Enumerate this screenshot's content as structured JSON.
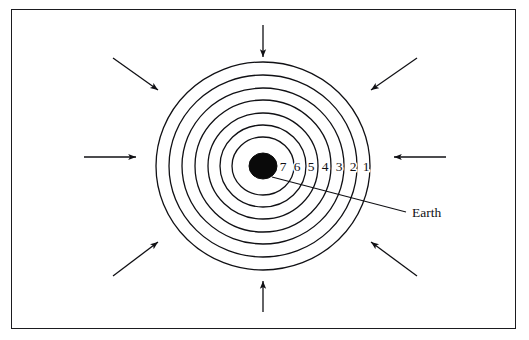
{
  "figure": {
    "title": "",
    "frame": {
      "x": 11,
      "y": 9,
      "width": 505,
      "height": 320,
      "stroke_color": "#1b1b1f",
      "stroke_width": 1.4,
      "background": "#ffffff"
    }
  },
  "chart_data": {
    "type": "diagram",
    "title": "",
    "subtitle": "",
    "center": {
      "x": 263,
      "y": 166
    },
    "core": {
      "label": "Earth",
      "fill": "#0a0a0a",
      "radius_x": 14,
      "radius_y": 13
    },
    "shell_count": 7,
    "shells": [
      {
        "label": "1",
        "index": 1,
        "radius_x": 107,
        "radius_y": 104,
        "label_x": 366,
        "label_y": 171
      },
      {
        "label": "2",
        "index": 2,
        "radius_x": 94,
        "radius_y": 91,
        "label_x": 353,
        "label_y": 171
      },
      {
        "label": "3",
        "index": 3,
        "radius_x": 81,
        "radius_y": 78,
        "label_x": 339,
        "label_y": 171
      },
      {
        "label": "4",
        "index": 4,
        "radius_x": 68,
        "radius_y": 66,
        "label_x": 325,
        "label_y": 171
      },
      {
        "label": "5",
        "index": 5,
        "radius_x": 55,
        "radius_y": 53,
        "label_x": 311,
        "label_y": 171
      },
      {
        "label": "6",
        "index": 6,
        "radius_x": 43,
        "radius_y": 41,
        "label_x": 297,
        "label_y": 171
      },
      {
        "label": "7",
        "index": 7,
        "radius_x": 31,
        "radius_y": 29,
        "label_x": 283,
        "label_y": 171
      }
    ],
    "shell_stroke_color": "#101014",
    "shell_stroke_width": 1.3,
    "annotations": [
      {
        "text": "Earth",
        "text_x": 412,
        "text_y": 217,
        "leader_from": {
          "x": 272,
          "y": 177
        },
        "leader_to": {
          "x": 406,
          "y": 212
        }
      }
    ],
    "arrows": {
      "count": 8,
      "direction": "inward",
      "color": "#101014",
      "stroke_width": 1.3,
      "items": [
        {
          "name": "arrow-top",
          "x1": 263,
          "y1": 25,
          "x2": 263,
          "y2": 57
        },
        {
          "name": "arrow-bottom",
          "x1": 263,
          "y1": 312,
          "x2": 263,
          "y2": 281
        },
        {
          "name": "arrow-left",
          "x1": 84,
          "y1": 157,
          "x2": 136,
          "y2": 157
        },
        {
          "name": "arrow-right",
          "x1": 446,
          "y1": 157,
          "x2": 394,
          "y2": 157
        },
        {
          "name": "arrow-top-left",
          "x1": 113,
          "y1": 58,
          "x2": 158,
          "y2": 90
        },
        {
          "name": "arrow-top-right",
          "x1": 417,
          "y1": 58,
          "x2": 371,
          "y2": 90
        },
        {
          "name": "arrow-bottom-left",
          "x1": 113,
          "y1": 276,
          "x2": 158,
          "y2": 242
        },
        {
          "name": "arrow-bottom-right",
          "x1": 417,
          "y1": 276,
          "x2": 371,
          "y2": 242
        }
      ]
    },
    "legend": [],
    "xlabel": "",
    "ylabel": ""
  }
}
